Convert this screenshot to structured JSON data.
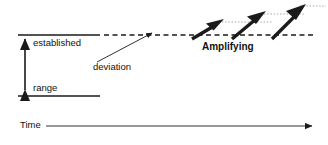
{
  "diagram": {
    "colors": {
      "stroke": "#1a1a1a",
      "background": "#ffffff",
      "dotted_guide": "#999999",
      "axis": "#333333"
    },
    "labels": {
      "established": "established",
      "range": "range",
      "deviation": "deviation",
      "amplifying": "Amplifying",
      "time": "Time"
    },
    "elements": {
      "range_band_top_line": "solid horizontal line marking top of established range",
      "range_band_bottom_line": "solid horizontal line marking bottom of established range",
      "range_span_arrow": "vertical double-headed arrow spanning the established range",
      "baseline_dashed_line": "dashed horizontal line extending right from the range top",
      "deviation_arrow": "thin arrow rising from below to the dashed baseline",
      "amplifying_arrows": "three bold arrows rising in increasing steps",
      "guide_dotted_lines": "dotted horizontal guides at each bold arrow tip",
      "time_axis_arrow": "horizontal arrow pointing right labelled Time"
    }
  }
}
